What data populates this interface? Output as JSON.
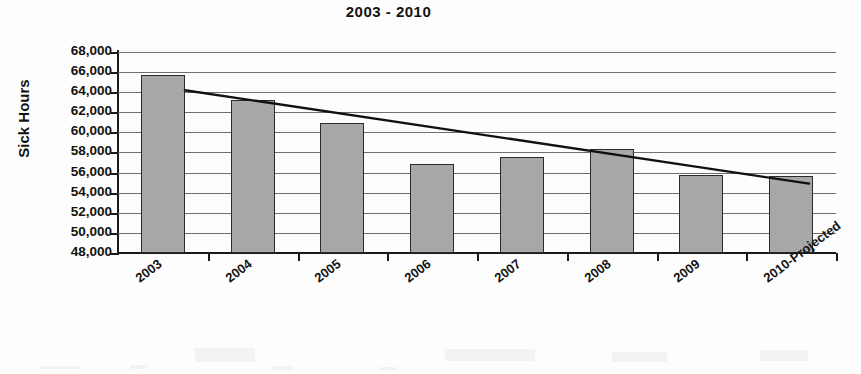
{
  "chart_data": {
    "type": "bar",
    "title": "2003 - 2010",
    "xlabel": "",
    "ylabel": "Sick Hours",
    "categories": [
      "2003",
      "2004",
      "2005",
      "2006",
      "2007",
      "2008",
      "2009",
      "2010-Projected"
    ],
    "values": [
      65700,
      63200,
      60900,
      56900,
      57600,
      58300,
      55800,
      55700
    ],
    "ylim": [
      48000,
      68000
    ],
    "ytick_labels": [
      "68,000",
      "66,000",
      "64,000",
      "62,000",
      "60,000",
      "58,000",
      "56,000",
      "54,000",
      "52,000",
      "50,000",
      "48,000"
    ],
    "ytick_values": [
      68000,
      66000,
      64000,
      62000,
      60000,
      58000,
      56000,
      54000,
      52000,
      50000,
      48000
    ],
    "grid": true,
    "legend": "none",
    "series": [
      {
        "name": "Sick Hours",
        "type": "bar",
        "color": "#a8a8a8",
        "border_color": "#2b2b2b",
        "values": [
          65700,
          63200,
          60900,
          56900,
          57600,
          58300,
          55800,
          55700
        ]
      },
      {
        "name": "Linear Trend",
        "type": "line",
        "color": "#111111",
        "start_value": 64200,
        "end_value": 54900
      }
    ],
    "annotations": []
  },
  "colors": {
    "bar_fill": "#a8a8a8",
    "bar_border": "#2b2b2b",
    "gridline": "#6f6f6f",
    "axis": "#1a1a1a",
    "trendline": "#111111",
    "text": "#131313",
    "background": "#fdfdfd"
  }
}
